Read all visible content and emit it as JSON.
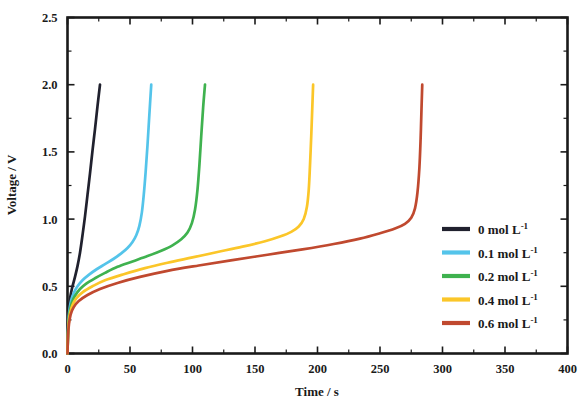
{
  "chart_data": {
    "type": "line",
    "title": "",
    "xlabel": "Time / s",
    "ylabel": "Voltage / V",
    "xlim": [
      0,
      400
    ],
    "ylim": [
      0.0,
      2.5
    ],
    "xticks": [
      0,
      50,
      100,
      150,
      200,
      250,
      300,
      350,
      400
    ],
    "xtick_labels": [
      "0",
      "50",
      "100",
      "150",
      "200",
      "250",
      "300",
      "350",
      "400"
    ],
    "xminor_step": 25,
    "yticks": [
      0.0,
      0.5,
      1.0,
      1.5,
      2.0,
      2.5
    ],
    "ytick_labels": [
      "0.0",
      "0.5",
      "1.0",
      "1.5",
      "2.0",
      "2.5"
    ],
    "yminor_step": 0.25,
    "grid": false,
    "legend_position": "right-middle",
    "series": [
      {
        "name": "0 mol L-1",
        "legend_text": "0 mol L",
        "legend_sup": "-1",
        "color": "#20212e",
        "points": [
          [
            0,
            0.0
          ],
          [
            0.4,
            0.18
          ],
          [
            0.9,
            0.3
          ],
          [
            1.6,
            0.38
          ],
          [
            2.6,
            0.44
          ],
          [
            4,
            0.5
          ],
          [
            6,
            0.57
          ],
          [
            8,
            0.65
          ],
          [
            10,
            0.75
          ],
          [
            12,
            0.88
          ],
          [
            14,
            1.02
          ],
          [
            16,
            1.18
          ],
          [
            18,
            1.34
          ],
          [
            20,
            1.51
          ],
          [
            22,
            1.67
          ],
          [
            24,
            1.84
          ],
          [
            26,
            2.0
          ]
        ]
      },
      {
        "name": "0.1 mol L-1",
        "legend_text": "0.1 mol L",
        "legend_sup": "-1",
        "color": "#54c4ea",
        "points": [
          [
            0,
            0.0
          ],
          [
            0.4,
            0.16
          ],
          [
            1.0,
            0.27
          ],
          [
            1.8,
            0.34
          ],
          [
            3,
            0.4
          ],
          [
            5,
            0.45
          ],
          [
            8,
            0.5
          ],
          [
            12,
            0.545
          ],
          [
            17,
            0.585
          ],
          [
            23,
            0.625
          ],
          [
            30,
            0.665
          ],
          [
            37,
            0.705
          ],
          [
            43,
            0.745
          ],
          [
            48,
            0.785
          ],
          [
            52,
            0.83
          ],
          [
            55,
            0.88
          ],
          [
            57.5,
            0.95
          ],
          [
            59.5,
            1.05
          ],
          [
            61,
            1.18
          ],
          [
            62.5,
            1.35
          ],
          [
            64,
            1.55
          ],
          [
            65.5,
            1.78
          ],
          [
            67,
            2.0
          ]
        ]
      },
      {
        "name": "0.2 mol L-1",
        "legend_text": "0.2 mol L",
        "legend_sup": "-1",
        "color": "#3fb24f",
        "points": [
          [
            0,
            0.0
          ],
          [
            0.4,
            0.15
          ],
          [
            1.0,
            0.25
          ],
          [
            2,
            0.32
          ],
          [
            3.5,
            0.38
          ],
          [
            6,
            0.43
          ],
          [
            10,
            0.48
          ],
          [
            15,
            0.52
          ],
          [
            22,
            0.56
          ],
          [
            30,
            0.6
          ],
          [
            40,
            0.645
          ],
          [
            52,
            0.685
          ],
          [
            64,
            0.725
          ],
          [
            75,
            0.765
          ],
          [
            84,
            0.805
          ],
          [
            91,
            0.85
          ],
          [
            96,
            0.9
          ],
          [
            99.5,
            0.97
          ],
          [
            102,
            1.07
          ],
          [
            104,
            1.22
          ],
          [
            105.5,
            1.4
          ],
          [
            107,
            1.62
          ],
          [
            108.5,
            1.83
          ],
          [
            110,
            2.0
          ]
        ]
      },
      {
        "name": "0.4 mol L-1",
        "legend_text": "0.4 mol L",
        "legend_sup": "-1",
        "color": "#fbc629",
        "points": [
          [
            0,
            0.0
          ],
          [
            0.4,
            0.14
          ],
          [
            1.0,
            0.23
          ],
          [
            2,
            0.3
          ],
          [
            4,
            0.36
          ],
          [
            7,
            0.41
          ],
          [
            12,
            0.455
          ],
          [
            20,
            0.5
          ],
          [
            30,
            0.545
          ],
          [
            45,
            0.59
          ],
          [
            62,
            0.635
          ],
          [
            80,
            0.675
          ],
          [
            100,
            0.715
          ],
          [
            120,
            0.755
          ],
          [
            140,
            0.795
          ],
          [
            158,
            0.835
          ],
          [
            170,
            0.87
          ],
          [
            179,
            0.905
          ],
          [
            185,
            0.945
          ],
          [
            189,
            1.0
          ],
          [
            191.5,
            1.09
          ],
          [
            193,
            1.22
          ],
          [
            194,
            1.4
          ],
          [
            195,
            1.62
          ],
          [
            195.8,
            1.82
          ],
          [
            196.5,
            2.0
          ]
        ]
      },
      {
        "name": "0.6 mol L-1",
        "legend_text": "0.6 mol L",
        "legend_sup": "-1",
        "color": "#c0492f",
        "points": [
          [
            0,
            0.0
          ],
          [
            0.4,
            0.13
          ],
          [
            1.2,
            0.22
          ],
          [
            2.5,
            0.29
          ],
          [
            5,
            0.345
          ],
          [
            9,
            0.39
          ],
          [
            16,
            0.435
          ],
          [
            26,
            0.48
          ],
          [
            40,
            0.525
          ],
          [
            58,
            0.57
          ],
          [
            80,
            0.615
          ],
          [
            105,
            0.655
          ],
          [
            132,
            0.695
          ],
          [
            160,
            0.735
          ],
          [
            188,
            0.775
          ],
          [
            213,
            0.815
          ],
          [
            234,
            0.855
          ],
          [
            250,
            0.895
          ],
          [
            262,
            0.93
          ],
          [
            270,
            0.965
          ],
          [
            275,
            1.01
          ],
          [
            278,
            1.08
          ],
          [
            280,
            1.2
          ],
          [
            281.5,
            1.38
          ],
          [
            282.5,
            1.6
          ],
          [
            283.2,
            1.82
          ],
          [
            283.8,
            2.0
          ]
        ]
      }
    ]
  },
  "legend": {
    "entries": [
      {
        "label": "0 mol L",
        "sup": "-1",
        "color": "#20212e"
      },
      {
        "label": "0.1 mol L",
        "sup": "-1",
        "color": "#54c4ea"
      },
      {
        "label": "0.2 mol L",
        "sup": "-1",
        "color": "#3fb24f"
      },
      {
        "label": "0.4 mol L",
        "sup": "-1",
        "color": "#fbc629"
      },
      {
        "label": "0.6 mol L",
        "sup": "-1",
        "color": "#c0492f"
      }
    ]
  }
}
